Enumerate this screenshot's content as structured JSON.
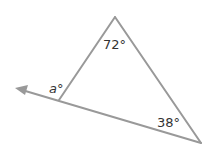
{
  "diagram": {
    "type": "triangle-exterior-angle",
    "stroke_color": "#999999",
    "label_color": "#333333",
    "angles": {
      "top": "72°",
      "bottom_right": "38°",
      "exterior": "a°"
    },
    "exterior_label_var": "a",
    "degree_symbol": "°"
  }
}
